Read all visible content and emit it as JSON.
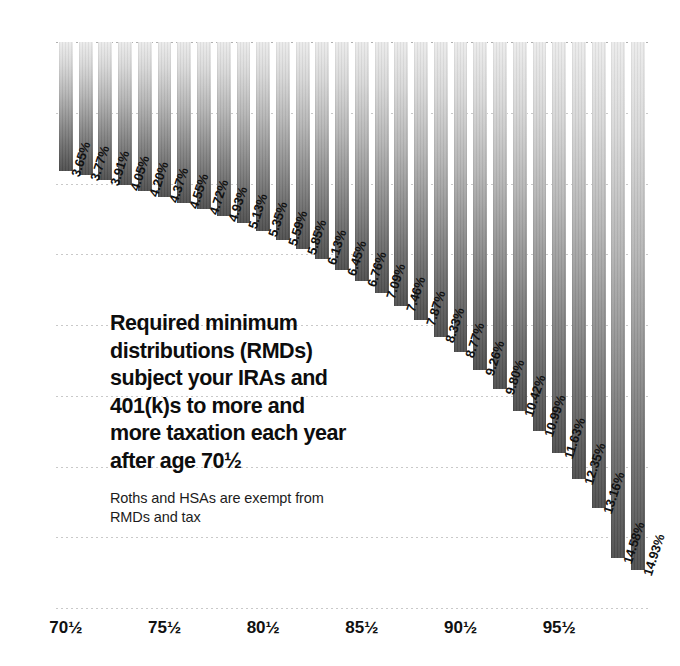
{
  "chart_data": {
    "type": "bar",
    "title": "Required minimum distributions (RMDs) subject your IRAs and 401(k)s to more and more taxation each year after age 70½",
    "subtitle": "Roths and HSAs are exempt from RMDs and tax",
    "xlabel": "",
    "ylabel": "",
    "ylim": [
      0,
      16
    ],
    "y_inverted": true,
    "grid": true,
    "legend": "none",
    "categories": [
      "70½",
      "71½",
      "72½",
      "73½",
      "74½",
      "75½",
      "76½",
      "77½",
      "78½",
      "79½",
      "80½",
      "81½",
      "82½",
      "83½",
      "84½",
      "85½",
      "86½",
      "87½",
      "88½",
      "89½",
      "90½",
      "91½",
      "92½",
      "93½",
      "94½",
      "95½",
      "96½",
      "97½",
      "98½",
      "99½"
    ],
    "values": [
      3.65,
      3.77,
      3.91,
      4.05,
      4.2,
      4.37,
      4.55,
      4.72,
      4.93,
      5.13,
      5.35,
      5.59,
      5.85,
      6.13,
      6.45,
      6.76,
      7.09,
      7.46,
      7.87,
      8.33,
      8.77,
      9.26,
      9.8,
      10.42,
      10.99,
      11.63,
      12.35,
      13.16,
      14.58,
      14.93
    ],
    "value_labels": [
      "3.65%",
      "3.77%",
      "3.91%",
      "4.05%",
      "4.20%",
      "4.37%",
      "4.55%",
      "4.72%",
      "4.93%",
      "5.13%",
      "5.35%",
      "5.59%",
      "5.85%",
      "6.13%",
      "6.45%",
      "6.76%",
      "7.09%",
      "7.46%",
      "7.87%",
      "8.33%",
      "8.77%",
      "9.26%",
      "9.80%",
      "10.42%",
      "10.99%",
      "11.63%",
      "12.35%",
      "13.16%",
      "14.58%",
      "14.93%"
    ],
    "y_ticks": [
      0,
      2,
      4,
      6,
      8,
      10,
      12,
      14,
      16
    ],
    "y_tick_labels": [
      "0%",
      "2%",
      "4%",
      "6%",
      "8%",
      "10%",
      "12%",
      "14%",
      "16%"
    ],
    "x_tick_labels": [
      "70½",
      "75½",
      "80½",
      "85½",
      "90½",
      "95½"
    ],
    "x_tick_indices": [
      0,
      5,
      10,
      15,
      20,
      25
    ],
    "colors": {
      "bar_gradient_top": "#ebebeb",
      "bar_gradient_bottom": "#4d4d4d",
      "gridline": "#c9c9c9",
      "text": "#111111",
      "background": "#ffffff"
    }
  },
  "annotation": {
    "headline": "Required minimum distributions (RMDs) subject your IRAs and 401(k)s to more and more taxation each year after age 70½",
    "subtext": "Roths and HSAs are exempt from RMDs and tax"
  }
}
